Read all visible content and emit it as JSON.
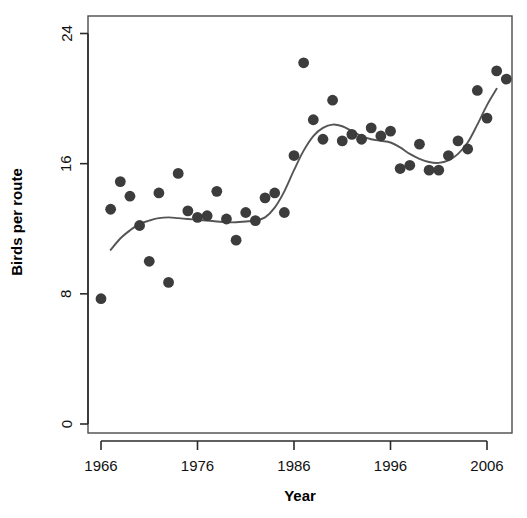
{
  "chart_data": {
    "type": "scatter",
    "title": "",
    "xlabel": "Year",
    "ylabel": "Birds per route",
    "xlim": [
      1965.0,
      2008.5
    ],
    "ylim": [
      -0.6,
      25.1
    ],
    "grid": false,
    "legend": null,
    "x_ticks": [
      1966,
      1976,
      1986,
      1996,
      2006
    ],
    "x_tick_labels": [
      "1966",
      "1976",
      "1986",
      "1996",
      "2006"
    ],
    "y_ticks": [
      0,
      8,
      16,
      24
    ],
    "y_tick_labels": [
      "0",
      "8",
      "16",
      "24"
    ],
    "series": [
      {
        "name": "Birds per route",
        "type": "scatter",
        "marker": "circle",
        "color": "#3c3c3c",
        "x": [
          1966,
          1967,
          1968,
          1969,
          1970,
          1971,
          1972,
          1973,
          1974,
          1975,
          1976,
          1977,
          1978,
          1979,
          1980,
          1981,
          1982,
          1983,
          1984,
          1985,
          1986,
          1987,
          1988,
          1989,
          1990,
          1991,
          1992,
          1993,
          1994,
          1995,
          1996,
          1997,
          1998,
          1999,
          2000,
          2001,
          2002,
          2003,
          2004,
          2005,
          2006,
          2007,
          2008
        ],
        "y": [
          7.7,
          13.2,
          14.9,
          14.0,
          12.2,
          10.0,
          14.2,
          8.7,
          15.4,
          13.1,
          12.7,
          12.8,
          14.3,
          12.6,
          11.3,
          13.0,
          12.5,
          13.9,
          14.2,
          13.0,
          16.5,
          22.2,
          18.7,
          17.5,
          19.9,
          17.4,
          17.8,
          17.5,
          18.2,
          17.7,
          18.0,
          15.7,
          15.9,
          17.2,
          15.6,
          15.6,
          16.5,
          17.4,
          16.9,
          20.5,
          18.8,
          21.7,
          21.2
        ]
      },
      {
        "name": "smoothed trend",
        "type": "line",
        "color": "#555555",
        "x": [
          1967.0,
          1968.0,
          1969.0,
          1970.0,
          1971.0,
          1972.0,
          1973.0,
          1974.0,
          1975.0,
          1976.0,
          1977.0,
          1978.0,
          1979.0,
          1980.0,
          1981.0,
          1982.0,
          1983.0,
          1984.0,
          1985.0,
          1986.0,
          1987.0,
          1988.0,
          1989.0,
          1990.0,
          1991.0,
          1992.0,
          1993.0,
          1994.0,
          1995.0,
          1996.0,
          1997.0,
          1998.0,
          1999.0,
          2000.0,
          2001.0,
          2002.0,
          2003.0,
          2004.0,
          2005.0,
          2006.0,
          2007.0
        ],
        "y": [
          10.7,
          11.4,
          11.9,
          12.3,
          12.5,
          12.65,
          12.7,
          12.65,
          12.6,
          12.55,
          12.5,
          12.45,
          12.4,
          12.4,
          12.45,
          12.5,
          12.7,
          13.3,
          14.3,
          15.6,
          16.8,
          17.7,
          18.2,
          18.4,
          18.3,
          18.0,
          17.7,
          17.5,
          17.4,
          17.3,
          17.0,
          16.6,
          16.3,
          16.1,
          16.05,
          16.2,
          16.6,
          17.3,
          18.4,
          19.6,
          20.6
        ]
      }
    ]
  },
  "axes": {
    "x_axis_name": "year-axis",
    "y_axis_name": "birds-axis"
  }
}
